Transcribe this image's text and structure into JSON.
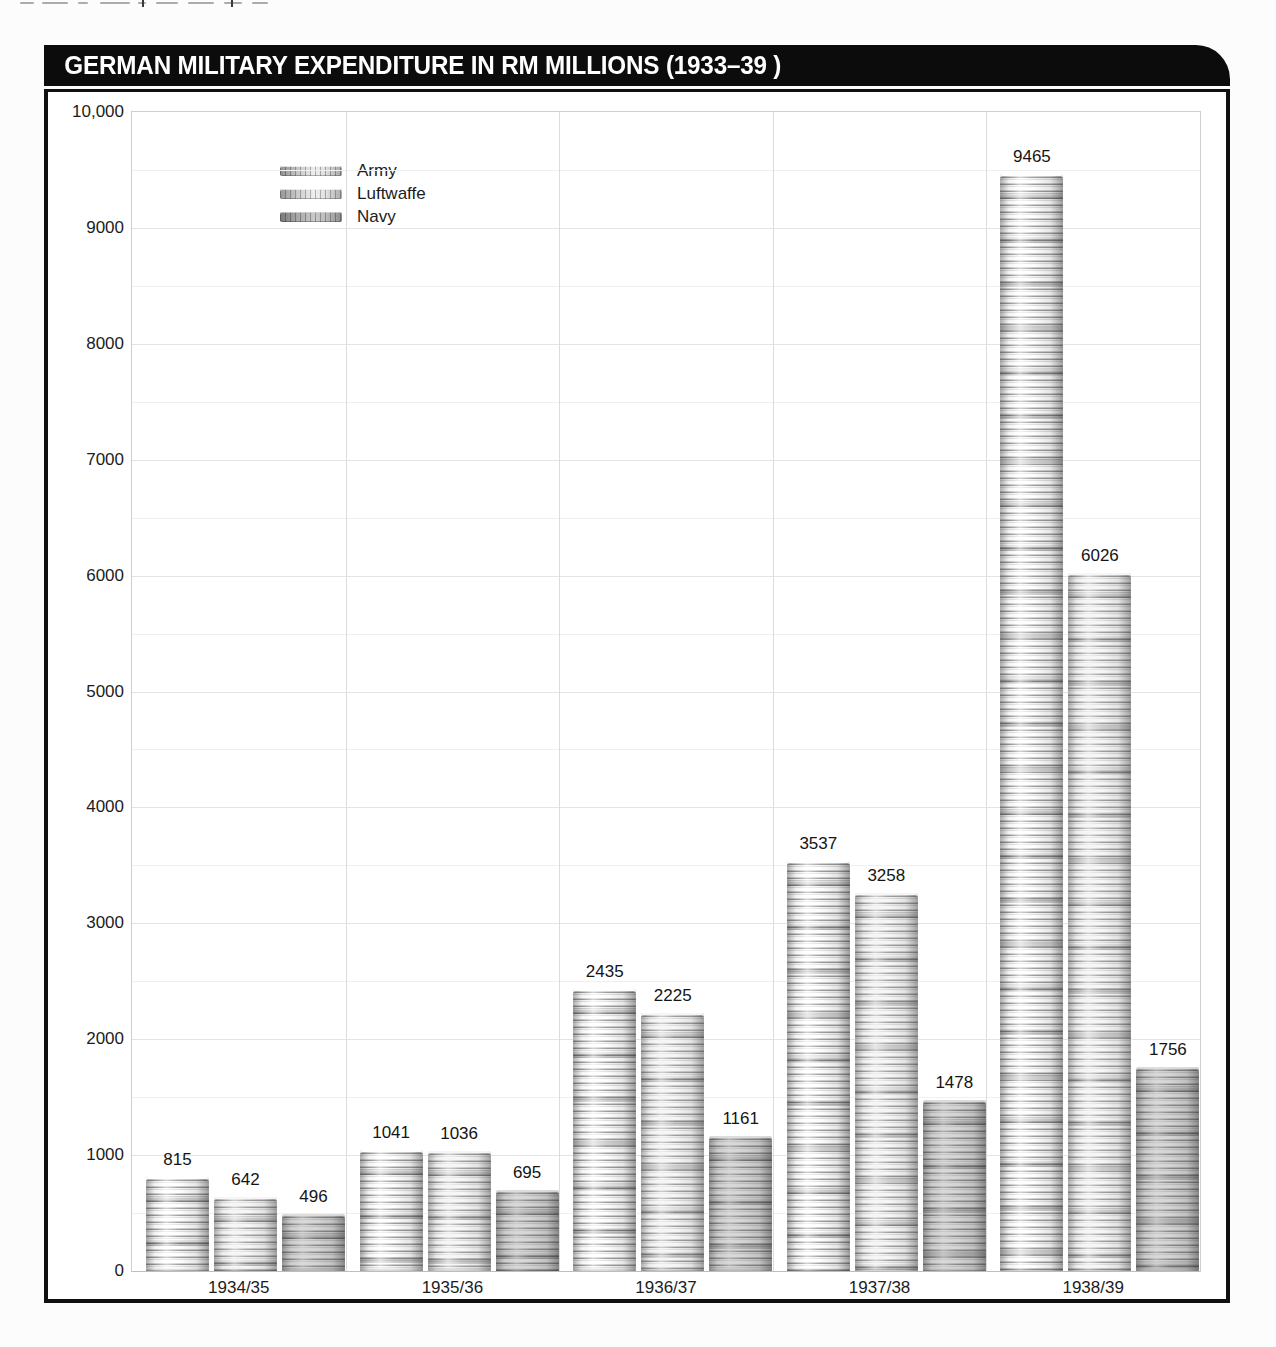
{
  "header": {
    "title": "GERMAN MILITARY EXPENDITURE IN RM MILLIONS (1933–39 )"
  },
  "chart_data": {
    "type": "bar",
    "title": "GERMAN MILITARY EXPENDITURE IN RM MILLIONS (1933–39 )",
    "unit": "RM millions",
    "categories": [
      "1934/35",
      "1935/36",
      "1936/37",
      "1937/38",
      "1938/39"
    ],
    "series": [
      {
        "name": "Army",
        "values": [
          815,
          1041,
          2435,
          3537,
          9465
        ]
      },
      {
        "name": "Luftwaffe",
        "values": [
          642,
          1036,
          2225,
          3258,
          6026
        ]
      },
      {
        "name": "Navy",
        "values": [
          496,
          695,
          1161,
          1478,
          1756
        ]
      }
    ],
    "ylim": [
      0,
      10000
    ],
    "ytick_interval": 1000,
    "minor_gridline_interval": 500,
    "yticklabels": [
      "0",
      "1000",
      "2000",
      "3000",
      "4000",
      "5000",
      "6000",
      "7000",
      "8000",
      "9000",
      "10,000"
    ],
    "xlabel": "",
    "ylabel": "",
    "grid": true,
    "legend_position": "top-left",
    "bar_style": "coin-stack",
    "value_labels_shown": true
  },
  "colors": {
    "header_bg": "#0c0c0c",
    "header_text": "#ffffff",
    "frame": "#101010",
    "plot_border": "#cfcfcf",
    "grid_major": "#e4e4e4",
    "grid_minor": "#f0f0f0",
    "group_divider": "#dcdcdc",
    "text": "#1c1c1c",
    "coin_light": "#f3f3f3",
    "coin_dark": "#8d8d8d"
  }
}
